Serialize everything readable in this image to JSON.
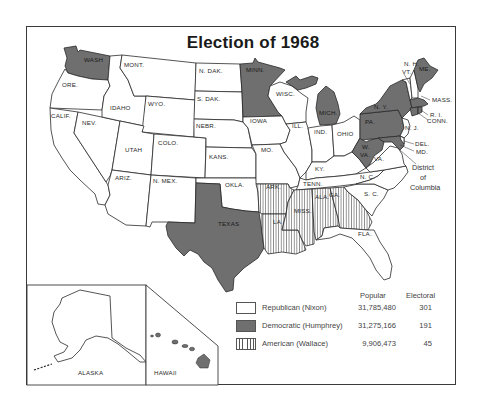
{
  "title": "Election of 1968",
  "colors": {
    "republican": "#ffffff",
    "democratic": "#6f6f6f",
    "american": "hatched vertical lines",
    "border": "#2a2a2a"
  },
  "states": {
    "wash": "WASH",
    "ore": "ORE.",
    "calif": "CALIF.",
    "nev": "NEV.",
    "idaho": "IDAHO",
    "mont": "MONT.",
    "wyo": "WYO.",
    "utah": "UTAH",
    "colo": "COLO.",
    "ariz": "ARIZ.",
    "nmex": "N. MEX.",
    "ndak": "N. DAK.",
    "sdak": "S. DAK.",
    "nebr": "NEBR.",
    "kans": "KANS.",
    "okla": "OKLA.",
    "texas": "TEXAS",
    "minn": "MINN.",
    "iowa": "IOWA",
    "mo": "MO.",
    "ark": "ARK.",
    "la": "LA.",
    "wisc": "WISC.",
    "ill": "ILL.",
    "mich": "MICH.",
    "ind": "IND.",
    "ohio": "OHIO",
    "ky": "KY.",
    "tenn": "TENN.",
    "miss": "MISS.",
    "ala": "ALA.",
    "ga": "GA.",
    "fla": "FLA.",
    "sc": "S. C.",
    "nc": "N. C.",
    "va": "VA.",
    "wva_1": "W.",
    "wva_2": "VA.",
    "pa": "PA.",
    "ny": "N. Y.",
    "nj": "N. J.",
    "del": "DEL.",
    "md": "MD.",
    "conn": "CONN.",
    "ri": "R. I.",
    "mass": "MASS.",
    "vt": "VT.",
    "nh": "N. H.",
    "me": "ME.",
    "dc_1": "District",
    "dc_2": "of",
    "dc_3": "Columbia",
    "alaska": "ALASKA",
    "hawaii": "HAWAII"
  },
  "legend": {
    "header_popular": "Popular",
    "header_electoral": "Electoral",
    "rows": [
      {
        "party": "Republican (Nixon)",
        "popular": "31,785,480",
        "electoral": "301",
        "pattern": "white"
      },
      {
        "party": "Democratic (Humphrey)",
        "popular": "31,275,166",
        "electoral": "191",
        "pattern": "gray"
      },
      {
        "party": "American (Wallace)",
        "popular": "9,906,473",
        "electoral": "45",
        "pattern": "hatched"
      }
    ]
  },
  "results": {
    "democratic_states": [
      "WASH",
      "MINN.",
      "MICH.",
      "TEXAS",
      "N. Y.",
      "PA.",
      "W. VA.",
      "MD.",
      "ME.",
      "MASS.",
      "R. I.",
      "CONN.",
      "District of Columbia",
      "HAWAII"
    ],
    "american_states": [
      "ARK.",
      "LA.",
      "MISS.",
      "ALA.",
      "GA."
    ]
  }
}
